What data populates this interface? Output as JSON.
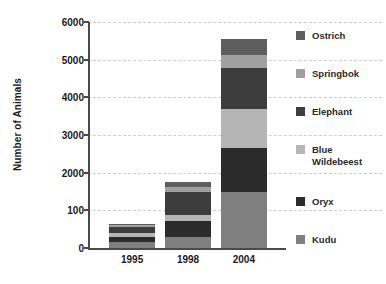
{
  "chart_data": {
    "type": "bar",
    "subtype": "stacked-bar",
    "title": "",
    "xlabel": "",
    "ylabel": "Number of Animals",
    "categories": [
      "1995",
      "1998",
      "2004"
    ],
    "ylim": [
      0,
      6000
    ],
    "yticks": [
      0,
      1000,
      2000,
      3000,
      4000,
      5000,
      6000
    ],
    "ytick_labels": [
      "0",
      "100",
      "2000",
      "3000",
      "4000",
      "5000",
      "6000"
    ],
    "ytick_label_note": "The 1000 gridline is labelled '100' in the original figure",
    "grid": true,
    "grid_style": "dashed",
    "legend_position": "right",
    "series": [
      {
        "name": "Kudu",
        "color": "#808080",
        "values": [
          170,
          300,
          1500
        ]
      },
      {
        "name": "Oryx",
        "color": "#2b2b2b",
        "values": [
          130,
          420,
          1150
        ]
      },
      {
        "name": "Blue Wildebeest",
        "color": "#b5b5b5",
        "values": [
          90,
          160,
          1050
        ]
      },
      {
        "name": "Elephant",
        "color": "#3d3d3d",
        "values": [
          170,
          620,
          1080
        ]
      },
      {
        "name": "Springbok",
        "color": "#a0a0a0",
        "values": [
          40,
          130,
          350
        ]
      },
      {
        "name": "Ostrich",
        "color": "#5e5e5e",
        "values": [
          50,
          120,
          420
        ]
      }
    ],
    "totals": [
      650,
      1750,
      5550
    ]
  },
  "legend": {
    "items": [
      {
        "label": "Ostrich",
        "color": "#5e5e5e"
      },
      {
        "label": "Springbok",
        "color": "#a0a0a0"
      },
      {
        "label": "Elephant",
        "color": "#3d3d3d"
      },
      {
        "label": "Blue\nWildebeest",
        "color": "#b5b5b5"
      },
      {
        "label": "Oryx",
        "color": "#2b2b2b"
      },
      {
        "label": "Kudu",
        "color": "#808080"
      }
    ]
  },
  "colors": {
    "axis": "#4a4a4a",
    "grid": "#cfcfcf",
    "text": "#1a1a1a",
    "background": "#ffffff"
  }
}
